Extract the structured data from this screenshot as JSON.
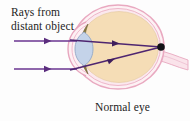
{
  "figure": {
    "background_color": "#fdfdfd",
    "width": 190,
    "height": 121
  },
  "labels": {
    "rays_line1": "Rays from",
    "rays_line2": "distant object",
    "caption": "Normal eye"
  },
  "colors": {
    "ray": "#5b2d7e",
    "ray_alt": "#7a3f9d",
    "sclera_outline": "#e8a8bf",
    "sclera_fill": "#fdf0f2",
    "vitreous_fill": "#f4dcb4",
    "lens_fill": "#c3d2e8",
    "lens_outline": "#8fa5c4",
    "iris_fill": "#8a7b42",
    "focal_point": "#131217",
    "text": "#1c1c22",
    "optic_nerve": "#f2c9d6"
  },
  "diagram": {
    "eyeball": {
      "center_x": 118,
      "center_y": 47,
      "radius_x": 46,
      "radius_y": 42,
      "description": "eyeball-sphere"
    },
    "lens": {
      "center_x": 84,
      "center_y": 49,
      "half_width": 9,
      "half_height": 17,
      "description": "crystalline-lens"
    },
    "cornea": {
      "apex_x": 72,
      "center_y": 49,
      "description": "cornea-front-bulge"
    },
    "focal_point": {
      "x": 161,
      "y": 47,
      "radius": 3.6,
      "description": "retina-focal-point"
    },
    "optic_nerve": {
      "start_x": 162,
      "start_y": 52,
      "end_x": 186,
      "end_y": 62,
      "description": "optic-nerve-stalk"
    },
    "incoming_rays": [
      {
        "name": "upper-incoming-ray",
        "x1": 14,
        "y1": 41,
        "x2": 76,
        "y2": 41,
        "arrow_at": 46
      },
      {
        "name": "lower-incoming-ray",
        "x1": 14,
        "y1": 69,
        "x2": 76,
        "y2": 69,
        "arrow_at": 46
      }
    ],
    "refracted_rays": [
      {
        "name": "upper-refracted-ray",
        "x1": 76,
        "y1": 41,
        "x2": 161,
        "y2": 47,
        "arrow_at": 122
      },
      {
        "name": "lower-refracted-ray",
        "x1": 76,
        "y1": 69,
        "x2": 161,
        "y2": 47,
        "arrow_at": 122
      }
    ]
  }
}
